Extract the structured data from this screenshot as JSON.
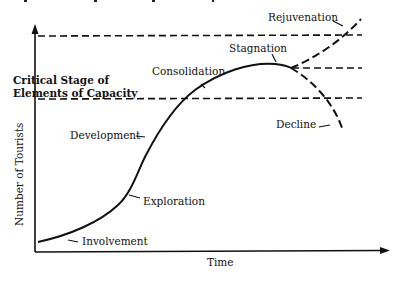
{
  "figure": {
    "cropped_title_visible": true,
    "axes": {
      "x_label": "Time",
      "y_label": "Number of Tourists"
    },
    "thresholds": {
      "label_line1": "Critical Stage of",
      "label_line2": "Elements of Capacity"
    },
    "stages": [
      {
        "id": "involvement",
        "label": "Involvement"
      },
      {
        "id": "exploration",
        "label": "Exploration"
      },
      {
        "id": "development",
        "label": "Development"
      },
      {
        "id": "consolidation",
        "label": "Consolidation"
      },
      {
        "id": "stagnation",
        "label": "Stagnation"
      },
      {
        "id": "rejuvenation",
        "label": "Rejuvenation"
      },
      {
        "id": "decline",
        "label": "Decline"
      }
    ],
    "colors": {
      "ink": "#111111",
      "background": "#ffffff"
    }
  }
}
